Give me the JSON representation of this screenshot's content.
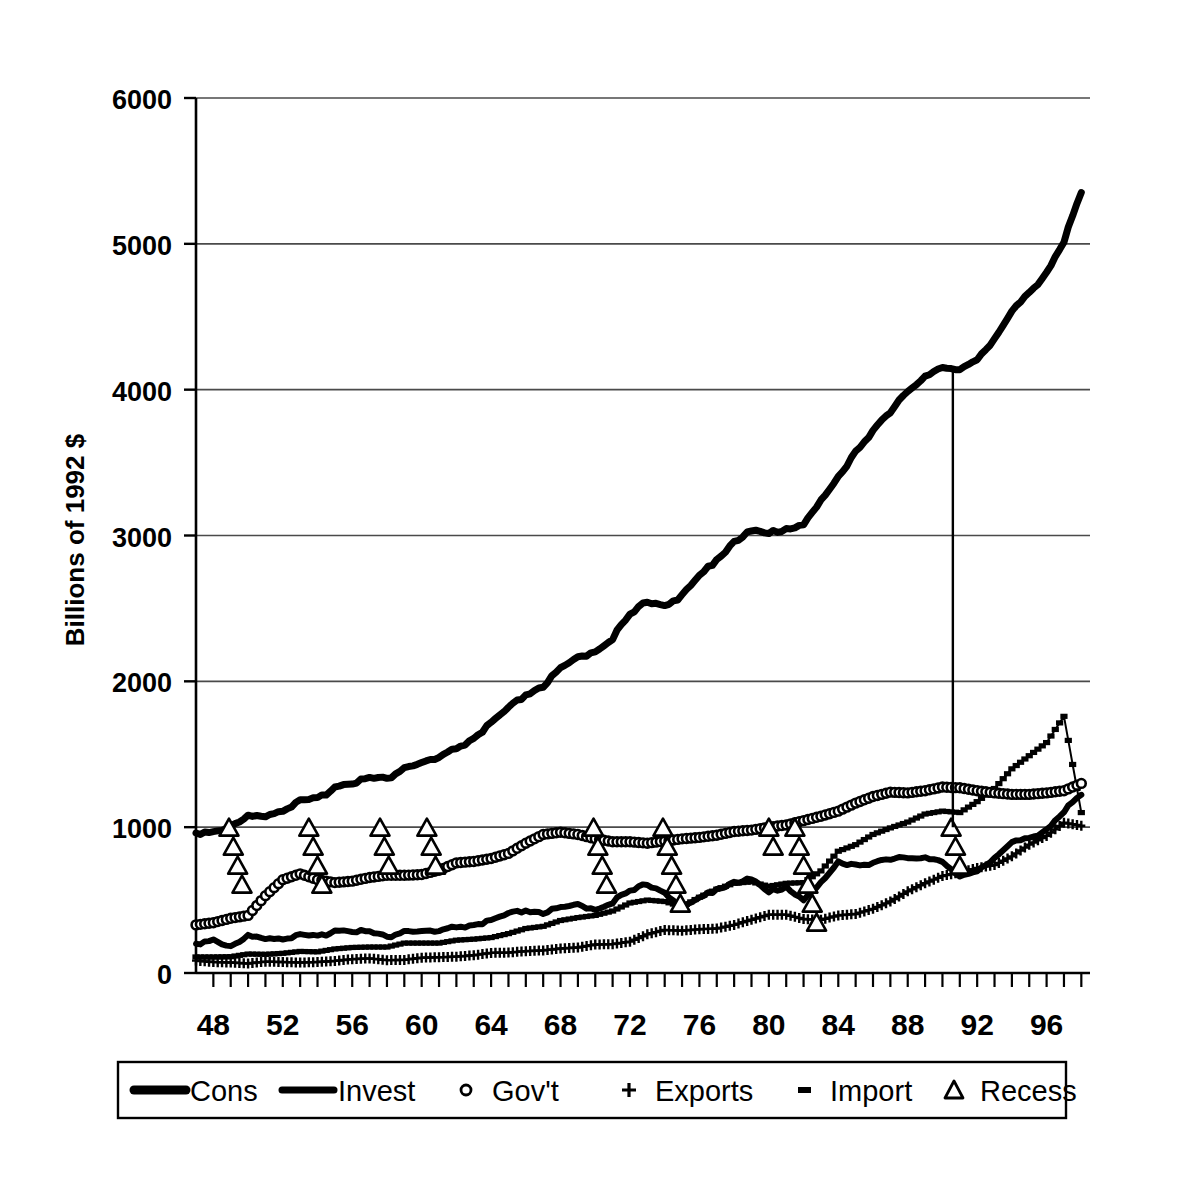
{
  "chart_data": {
    "type": "line",
    "title": "",
    "subtitle": "",
    "xlabel": "",
    "ylabel": "Billions of 1992 $",
    "xlim": [
      1947.0,
      1998.5
    ],
    "ylim": [
      0,
      6000
    ],
    "grid": true,
    "grid_axis": "y",
    "legend_position": "bottom",
    "yticks": [
      0,
      1000,
      2000,
      3000,
      4000,
      5000,
      6000
    ],
    "ytick_labels": [
      "0",
      "1000",
      "2000",
      "3000",
      "4000",
      "5000",
      "6000"
    ],
    "xticks": [
      1948,
      1952,
      1956,
      1960,
      1964,
      1968,
      1972,
      1976,
      1980,
      1984,
      1988,
      1992,
      1996
    ],
    "xtick_labels": [
      "48",
      "52",
      "56",
      "60",
      "64",
      "68",
      "72",
      "76",
      "80",
      "84",
      "88",
      "92",
      "96"
    ],
    "x_minor_tick_interval": 1,
    "annotations": [
      {
        "name": "recession-vertical-line",
        "type": "vline",
        "x": 1990.6,
        "y_from": 1000,
        "y_to": 4150
      }
    ],
    "series": [
      {
        "name": "Cons",
        "label": "Cons",
        "marker": "none",
        "linewidth": 7,
        "color": "#000000",
        "x": [
          1947,
          1948,
          1949,
          1950,
          1951,
          1952,
          1953,
          1954,
          1955,
          1956,
          1957,
          1958,
          1959,
          1960,
          1961,
          1962,
          1963,
          1964,
          1965,
          1966,
          1967,
          1968,
          1969,
          1970,
          1971,
          1972,
          1973,
          1974,
          1975,
          1976,
          1977,
          1978,
          1979,
          1980,
          1981,
          1982,
          1983,
          1984,
          1985,
          1986,
          1987,
          1988,
          1989,
          1990,
          1991,
          1992,
          1993,
          1994,
          1995,
          1996,
          1997,
          1998
        ],
        "values": [
          960,
          975,
          1000,
          1070,
          1085,
          1120,
          1175,
          1190,
          1280,
          1310,
          1335,
          1330,
          1410,
          1440,
          1470,
          1540,
          1610,
          1710,
          1810,
          1910,
          1970,
          2080,
          2160,
          2210,
          2300,
          2450,
          2550,
          2530,
          2580,
          2720,
          2840,
          2960,
          3030,
          3010,
          3050,
          3080,
          3230,
          3400,
          3580,
          3720,
          3840,
          3990,
          4100,
          4150,
          4125,
          4220,
          4350,
          4530,
          4660,
          4810,
          5020,
          5350
        ],
        "units": "Billions of 1992 $",
        "description": "Real personal consumption expenditures, quarterly, rising from ~960 in 1947 to ~5350 in 1998"
      },
      {
        "name": "Invest",
        "label": "Invest",
        "marker": "none",
        "linewidth": 3,
        "color": "#000000",
        "x": [
          1947,
          1948,
          1949,
          1950,
          1951,
          1952,
          1953,
          1954,
          1955,
          1956,
          1957,
          1958,
          1959,
          1960,
          1961,
          1962,
          1963,
          1964,
          1965,
          1966,
          1967,
          1968,
          1969,
          1970,
          1971,
          1972,
          1973,
          1974,
          1975,
          1976,
          1977,
          1978,
          1979,
          1980,
          1981,
          1982,
          1983,
          1984,
          1985,
          1986,
          1987,
          1988,
          1989,
          1990,
          1991,
          1992,
          1993,
          1994,
          1995,
          1996,
          1997,
          1998
        ],
        "values": [
          200,
          235,
          175,
          250,
          245,
          240,
          255,
          245,
          295,
          295,
          280,
          245,
          290,
          285,
          280,
          315,
          330,
          355,
          400,
          430,
          415,
          440,
          465,
          440,
          490,
          555,
          610,
          560,
          440,
          510,
          580,
          625,
          640,
          550,
          595,
          505,
          610,
          760,
          745,
          755,
          775,
          790,
          800,
          760,
          650,
          710,
          790,
          890,
          920,
          990,
          1110,
          1220
        ],
        "units": "Billions of 1992 $",
        "description": "Real gross private domestic investment, volatile with deep recession troughs in 1975 and 1982"
      },
      {
        "name": "Gov't",
        "label": "Gov't",
        "marker": "circle",
        "linewidth": 3,
        "color": "#000000",
        "x": [
          1947,
          1948,
          1949,
          1950,
          1951,
          1952,
          1953,
          1954,
          1955,
          1956,
          1957,
          1958,
          1959,
          1960,
          1961,
          1962,
          1963,
          1964,
          1965,
          1966,
          1967,
          1968,
          1969,
          1970,
          1971,
          1972,
          1973,
          1974,
          1975,
          1976,
          1977,
          1978,
          1979,
          1980,
          1981,
          1982,
          1983,
          1984,
          1985,
          1986,
          1987,
          1988,
          1989,
          1990,
          1991,
          1992,
          1993,
          1994,
          1995,
          1996,
          1997,
          1998
        ],
        "values": [
          330,
          345,
          375,
          395,
          530,
          640,
          680,
          640,
          620,
          630,
          655,
          670,
          670,
          675,
          705,
          755,
          765,
          785,
          820,
          890,
          950,
          965,
          950,
          920,
          900,
          900,
          890,
          905,
          920,
          930,
          945,
          970,
          980,
          1000,
          1015,
          1045,
          1075,
          1110,
          1165,
          1210,
          1240,
          1235,
          1250,
          1275,
          1270,
          1250,
          1235,
          1225,
          1225,
          1235,
          1250,
          1300
        ],
        "units": "Billions of 1992 $",
        "description": "Real government consumption and investment, with Korean War buildup 1950-53 and Vietnam buildup 1965-68"
      },
      {
        "name": "Exports",
        "label": "Exports",
        "marker": "plus",
        "linewidth": 2,
        "color": "#000000",
        "x": [
          1947,
          1948,
          1949,
          1950,
          1951,
          1952,
          1953,
          1954,
          1955,
          1956,
          1957,
          1958,
          1959,
          1960,
          1961,
          1962,
          1963,
          1964,
          1965,
          1966,
          1967,
          1968,
          1969,
          1970,
          1971,
          1972,
          1973,
          1974,
          1975,
          1976,
          1977,
          1978,
          1979,
          1980,
          1981,
          1982,
          1983,
          1984,
          1985,
          1986,
          1987,
          1988,
          1989,
          1990,
          1991,
          1992,
          1993,
          1994,
          1995,
          1996,
          1997,
          1998
        ],
        "values": [
          85,
          75,
          72,
          65,
          78,
          75,
          72,
          75,
          83,
          95,
          100,
          88,
          90,
          105,
          108,
          112,
          122,
          138,
          140,
          150,
          155,
          168,
          175,
          195,
          198,
          215,
          265,
          295,
          290,
          300,
          305,
          330,
          365,
          400,
          400,
          370,
          365,
          395,
          405,
          440,
          490,
          560,
          615,
          665,
          690,
          720,
          740,
          800,
          880,
          940,
          1030,
          1010
        ],
        "units": "Billions of 1992 $",
        "description": "Real exports of goods and services, accelerating sharply after 1986"
      },
      {
        "name": "Import",
        "label": "Import",
        "marker": "dash",
        "linewidth": 2,
        "color": "#000000",
        "x": [
          1947,
          1948,
          1949,
          1950,
          1951,
          1952,
          1953,
          1954,
          1955,
          1956,
          1957,
          1958,
          1959,
          1960,
          1961,
          1962,
          1963,
          1964,
          1965,
          1966,
          1967,
          1968,
          1969,
          1970,
          1971,
          1972,
          1973,
          1974,
          1975,
          1976,
          1977,
          1978,
          1979,
          1980,
          1981,
          1982,
          1983,
          1984,
          1985,
          1986,
          1987,
          1988,
          1989,
          1990,
          1991,
          1992,
          1993,
          1994,
          1995,
          1996,
          1997,
          1998
        ],
        "values": [
          110,
          110,
          112,
          130,
          128,
          135,
          148,
          145,
          165,
          175,
          178,
          178,
          205,
          205,
          205,
          225,
          232,
          243,
          270,
          305,
          320,
          360,
          380,
          395,
          425,
          480,
          500,
          490,
          455,
          520,
          575,
          615,
          625,
          595,
          615,
          620,
          700,
          835,
          880,
          950,
          995,
          1035,
          1090,
          1110,
          1100,
          1175,
          1265,
          1400,
          1490,
          1580,
          1760,
          1100
        ],
        "units": "Billions of 1992 $",
        "description": "Real imports of goods and services, rising steeply through the 1990s"
      },
      {
        "name": "Recess",
        "label": "Recess",
        "marker": "triangle",
        "linewidth": 0,
        "color": "#000000",
        "type": "markers-only",
        "description": "Recession indicator: vertical stacks of open triangles descending from 1000 during NBER recession quarters",
        "recession_periods": [
          {
            "start": 1948.9,
            "end": 1949.8,
            "label": "1948-49"
          },
          {
            "start": 1953.5,
            "end": 1954.4,
            "label": "1953-54"
          },
          {
            "start": 1957.6,
            "end": 1958.3,
            "label": "1957-58"
          },
          {
            "start": 1960.3,
            "end": 1961.1,
            "label": "1960-61"
          },
          {
            "start": 1969.9,
            "end": 1970.8,
            "label": "1969-70"
          },
          {
            "start": 1973.9,
            "end": 1975.1,
            "label": "1973-75"
          },
          {
            "start": 1980.0,
            "end": 1980.5,
            "label": "1980"
          },
          {
            "start": 1981.5,
            "end": 1982.9,
            "label": "1981-82"
          },
          {
            "start": 1990.5,
            "end": 1991.2,
            "label": "1990-91"
          }
        ]
      }
    ]
  },
  "legend": {
    "items": [
      {
        "label": "Cons",
        "marker": "thick-line"
      },
      {
        "label": "Invest",
        "marker": "thin-line"
      },
      {
        "label": "Gov't",
        "marker": "circle"
      },
      {
        "label": "Exports",
        "marker": "plus"
      },
      {
        "label": "Import",
        "marker": "dash"
      },
      {
        "label": "Recess",
        "marker": "triangle"
      }
    ]
  },
  "colors": {
    "ink": "#000000",
    "grid": "#555555",
    "background": "#ffffff"
  }
}
